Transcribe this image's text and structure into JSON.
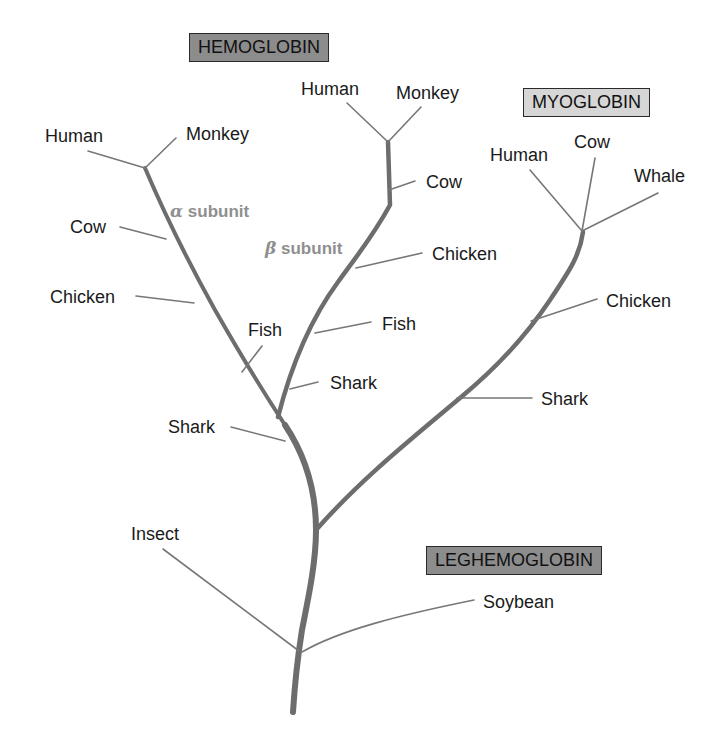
{
  "families": {
    "hemoglobin": {
      "label": "HEMOGLOBIN",
      "fill": "#8c8c8c"
    },
    "myoglobin": {
      "label": "MYOGLOBIN",
      "fill": "#d6d6d6"
    },
    "leghemoglobin": {
      "label": "LEGHEMOGLOBIN",
      "fill": "#8c8c8c"
    }
  },
  "subunits": {
    "alpha": {
      "greek": "α",
      "text": "subunit"
    },
    "beta": {
      "greek": "β",
      "text": "subunit"
    }
  },
  "alpha_branch": {
    "human": "Human",
    "monkey": "Monkey",
    "cow": "Cow",
    "chicken": "Chicken",
    "fish": "Fish",
    "shark": "Shark"
  },
  "beta_branch": {
    "human": "Human",
    "monkey": "Monkey",
    "cow": "Cow",
    "chicken": "Chicken",
    "fish": "Fish",
    "shark": "Shark"
  },
  "myoglobin_branch": {
    "human": "Human",
    "cow": "Cow",
    "whale": "Whale",
    "chicken": "Chicken",
    "shark": "Shark"
  },
  "root_branch": {
    "insect": "Insect",
    "soybean": "Soybean"
  },
  "colors": {
    "trunk": "#6d6d6d",
    "twig": "#777777",
    "subunit_text": "#8f8f8f"
  }
}
